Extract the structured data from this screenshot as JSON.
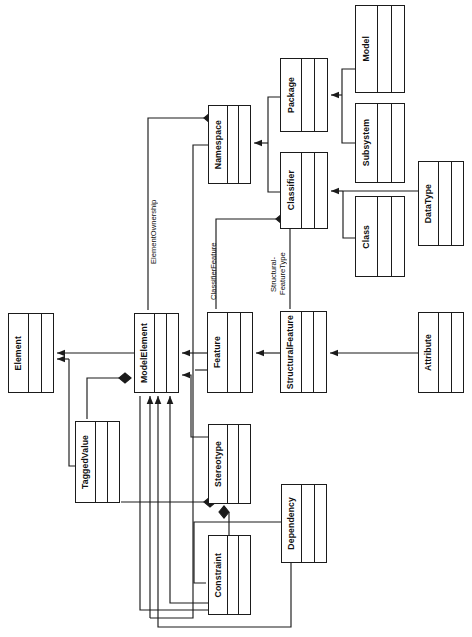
{
  "diagram": {
    "orientation": "rotated-90-ccw",
    "stroke_color": "#1b1b1b",
    "fill_color": "#ffffff",
    "background": "#ffffff",
    "classes": [
      {
        "id": "model",
        "label": "Model",
        "x": 355,
        "y": 5,
        "w": 50,
        "h": 88
      },
      {
        "id": "subsystem",
        "label": "Subsystem",
        "x": 355,
        "y": 103,
        "w": 50,
        "h": 80
      },
      {
        "id": "class",
        "label": "Class",
        "x": 355,
        "y": 196,
        "w": 50,
        "h": 81
      },
      {
        "id": "datatype",
        "label": "DataType",
        "x": 418,
        "y": 161,
        "w": 46,
        "h": 85
      },
      {
        "id": "package",
        "label": "Package",
        "x": 280,
        "y": 58,
        "w": 48,
        "h": 74
      },
      {
        "id": "classifier",
        "label": "Classifier",
        "x": 280,
        "y": 152,
        "w": 48,
        "h": 77
      },
      {
        "id": "namespace",
        "label": "Namespace",
        "x": 208,
        "y": 105,
        "w": 43,
        "h": 79
      },
      {
        "id": "element",
        "label": "Element",
        "x": 8,
        "y": 313,
        "w": 46,
        "h": 80
      },
      {
        "id": "modelelement",
        "label": "ModelElement",
        "x": 134,
        "y": 313,
        "w": 45,
        "h": 80
      },
      {
        "id": "feature",
        "label": "Feature",
        "x": 207,
        "y": 312,
        "w": 46,
        "h": 81
      },
      {
        "id": "structuralfeature",
        "label": "StructuralFeature",
        "x": 280,
        "y": 311,
        "w": 47,
        "h": 82
      },
      {
        "id": "attribute",
        "label": "Attribute",
        "x": 418,
        "y": 312,
        "w": 46,
        "h": 81
      },
      {
        "id": "taggedvalue",
        "label": "TaggedValue",
        "x": 75,
        "y": 421,
        "w": 45,
        "h": 82
      },
      {
        "id": "stereotype",
        "label": "Stereotype",
        "x": 208,
        "y": 424,
        "w": 43,
        "h": 80
      },
      {
        "id": "constraint",
        "label": "Constraint",
        "x": 208,
        "y": 535,
        "w": 43,
        "h": 80
      },
      {
        "id": "dependency",
        "label": "Dependency",
        "x": 281,
        "y": 484,
        "w": 46,
        "h": 79
      }
    ],
    "association_labels": [
      {
        "id": "element-ownership",
        "text": "ElementOwnership",
        "x": 150,
        "y": 186,
        "w": 12,
        "h": 92
      },
      {
        "id": "classifier-feature",
        "text": "ClassifierFeature",
        "x": 210,
        "y": 232,
        "w": 12,
        "h": 78
      },
      {
        "id": "structural-feature-type",
        "text": "Structural-\nFeatureType",
        "x": 270,
        "y": 240,
        "w": 22,
        "h": 68
      }
    ],
    "relationships": [
      {
        "id": "model-to-package",
        "type": "generalization",
        "from": "Model",
        "to": "Package"
      },
      {
        "id": "subsystem-to-package",
        "type": "generalization",
        "from": "Subsystem",
        "to": "Package"
      },
      {
        "id": "class-to-classifier",
        "type": "generalization",
        "from": "Class",
        "to": "Classifier"
      },
      {
        "id": "datatype-to-classifier",
        "type": "generalization",
        "from": "DataType",
        "to": "Classifier"
      },
      {
        "id": "package-to-namespace",
        "type": "generalization",
        "from": "Package",
        "to": "Namespace"
      },
      {
        "id": "classifier-to-namespace",
        "type": "generalization",
        "from": "Classifier",
        "to": "Namespace"
      },
      {
        "id": "namespace-to-modelelement",
        "type": "generalization",
        "from": "Namespace",
        "to": "ModelElement"
      },
      {
        "id": "modelelement-to-element",
        "type": "generalization",
        "from": "ModelElement",
        "to": "Element"
      },
      {
        "id": "feature-to-modelelement",
        "type": "generalization",
        "from": "Feature",
        "to": "ModelElement"
      },
      {
        "id": "structuralfeature-to-feature",
        "type": "generalization",
        "from": "StructuralFeature",
        "to": "Feature"
      },
      {
        "id": "attribute-to-structuralfeature",
        "type": "generalization",
        "from": "Attribute",
        "to": "StructuralFeature"
      },
      {
        "id": "taggedvalue-to-element",
        "type": "generalization",
        "from": "TaggedValue",
        "to": "Element"
      },
      {
        "id": "stereotype-to-modelelement",
        "type": "generalization",
        "from": "Stereotype",
        "to": "ModelElement"
      },
      {
        "id": "constraint-to-modelelement",
        "type": "generalization",
        "from": "Constraint",
        "to": "ModelElement"
      },
      {
        "id": "dependency-to-modelelement",
        "type": "generalization",
        "from": "Dependency",
        "to": "ModelElement"
      },
      {
        "id": "namespace-owns-modelelement",
        "type": "composition",
        "from": "Namespace",
        "to": "ModelElement",
        "label": "ElementOwnership"
      },
      {
        "id": "classifier-owns-feature",
        "type": "composition",
        "from": "Classifier",
        "to": "Feature",
        "label": "ClassifierFeature"
      },
      {
        "id": "modelelement-owns-taggedvalue",
        "type": "composition",
        "from": "ModelElement",
        "to": "TaggedValue"
      },
      {
        "id": "stereotype-owns-constraint",
        "type": "composition",
        "from": "Stereotype",
        "to": "Constraint"
      },
      {
        "id": "stereotype-taggedvalue-composition",
        "type": "composition",
        "from": "Stereotype",
        "to": "TaggedValue"
      },
      {
        "id": "structuralfeature-type-classifier",
        "type": "association",
        "from": "StructuralFeature",
        "to": "Classifier",
        "label": "Structural-FeatureType"
      }
    ]
  }
}
